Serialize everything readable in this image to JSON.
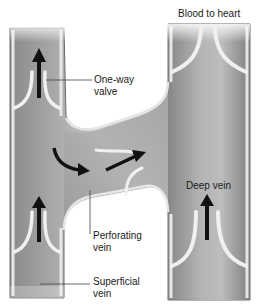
{
  "diagram": {
    "type": "anatomical illustration",
    "labels": {
      "top": "Blood to heart",
      "valve": {
        "line1": "One-way",
        "line2": "valve"
      },
      "deep": "Deep vein",
      "perforating": {
        "line1": "Perforating",
        "line2": "vein"
      },
      "superficial": {
        "line1": "Superficial",
        "line2": "vein"
      }
    },
    "structures": [
      {
        "name": "superficial vein",
        "position": "left",
        "flow": "upward"
      },
      {
        "name": "deep vein",
        "position": "right",
        "flow": "upward"
      },
      {
        "name": "perforating vein",
        "position": "middle",
        "flow": "superficial to deep"
      },
      {
        "name": "one-way valve",
        "count": 4
      }
    ],
    "arrows": [
      {
        "location": "superficial vein upper",
        "direction": "up"
      },
      {
        "location": "superficial vein lower",
        "direction": "up"
      },
      {
        "location": "junction",
        "direction": "curved down-right"
      },
      {
        "location": "perforating vein",
        "direction": "up-right"
      },
      {
        "location": "deep vein",
        "direction": "up"
      }
    ],
    "colors": {
      "vein_fill": "#b8b8b8",
      "vein_dark": "#7a7a7a",
      "vein_wall": "#e8e8e8",
      "arrow": "#111111",
      "leader_line": "#444444"
    }
  }
}
